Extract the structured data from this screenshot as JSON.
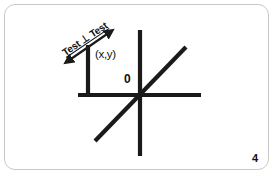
{
  "slide": {
    "page_number": "4",
    "background_color": "#ffffff",
    "border_color": "#c9c9c9",
    "ink_color": "#1a1a1a"
  },
  "diagram": {
    "labels": {
      "point_label": "(x,y)",
      "origin_label": "0",
      "perpendicular_text": "Test ⊥ Test"
    },
    "icons": {
      "double_arrow": "double-headed-arrow-icon"
    },
    "geometry": {
      "vertical_axis": {
        "x1": 140,
        "y1": 30,
        "x2": 140,
        "y2": 156
      },
      "horizontal_axis": {
        "x1": 78,
        "y1": 95,
        "x2": 201,
        "y2": 95
      },
      "diagonal_line": {
        "x1": 95,
        "y1": 141,
        "x2": 186,
        "y2": 47
      },
      "vertical_stub": {
        "x1": 88,
        "y1": 45,
        "x2": 88,
        "y2": 95
      },
      "arrow_line": {
        "x1": 66,
        "y1": 62,
        "x2": 112,
        "y2": 30
      },
      "stroke_width": 4
    }
  }
}
